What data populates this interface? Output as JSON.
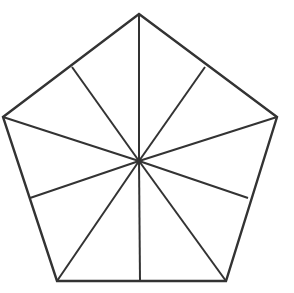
{
  "figure": {
    "name": "pentagon-with-ten-radial-triangles",
    "canvas": {
      "width": 294,
      "height": 293,
      "background_color": "#FFFFFF"
    },
    "style": {
      "stroke_color": "#333333",
      "outline_stroke_width": 2.4,
      "spoke_stroke_width": 2.0,
      "fill_color": "#FFFFFF",
      "line_join": "miter",
      "line_cap": "butt"
    },
    "counts": {
      "vertices": 5,
      "sides": 5,
      "edge_midpoints": 5,
      "radial_spokes": 10,
      "triangles": 10
    },
    "center": {
      "label": "center",
      "x": 139,
      "y": 161
    },
    "vertices": [
      {
        "label": "apex-top",
        "x": 139,
        "y": 14
      },
      {
        "label": "right",
        "x": 277,
        "y": 117
      },
      {
        "label": "bottom-right",
        "x": 226,
        "y": 281
      },
      {
        "label": "bottom-left",
        "x": 57,
        "y": 281
      },
      {
        "label": "left",
        "x": 3,
        "y": 117
      }
    ],
    "edge_midpoints": [
      {
        "label": "midpoint-upper-right",
        "x": 205,
        "y": 67
      },
      {
        "label": "midpoint-lower-right",
        "x": 248,
        "y": 198
      },
      {
        "label": "midpoint-bottom",
        "x": 140,
        "y": 281
      },
      {
        "label": "midpoint-lower-left",
        "x": 30,
        "y": 198
      },
      {
        "label": "midpoint-upper-left",
        "x": 72,
        "y": 67
      }
    ],
    "outline_path": "M139,14 L277,117 L226,281 L57,281 L3,117 Z",
    "spokes": [
      {
        "label": "spoke-to-apex-top",
        "path": "M139,161 L139,14"
      },
      {
        "label": "spoke-to-midpoint-upper-right",
        "path": "M139,161 L205,67"
      },
      {
        "label": "spoke-to-right",
        "path": "M139,161 L277,117"
      },
      {
        "label": "spoke-to-midpoint-lower-right",
        "path": "M139,161 L248,198"
      },
      {
        "label": "spoke-to-bottom-right",
        "path": "M139,161 L226,281"
      },
      {
        "label": "spoke-to-midpoint-bottom",
        "path": "M139,161 L140,281"
      },
      {
        "label": "spoke-to-bottom-left",
        "path": "M139,161 L57,281"
      },
      {
        "label": "spoke-to-midpoint-lower-left",
        "path": "M139,161 L30,198"
      },
      {
        "label": "spoke-to-left",
        "path": "M139,161 L3,117"
      },
      {
        "label": "spoke-to-midpoint-upper-left",
        "path": "M139,161 L72,67"
      }
    ]
  }
}
